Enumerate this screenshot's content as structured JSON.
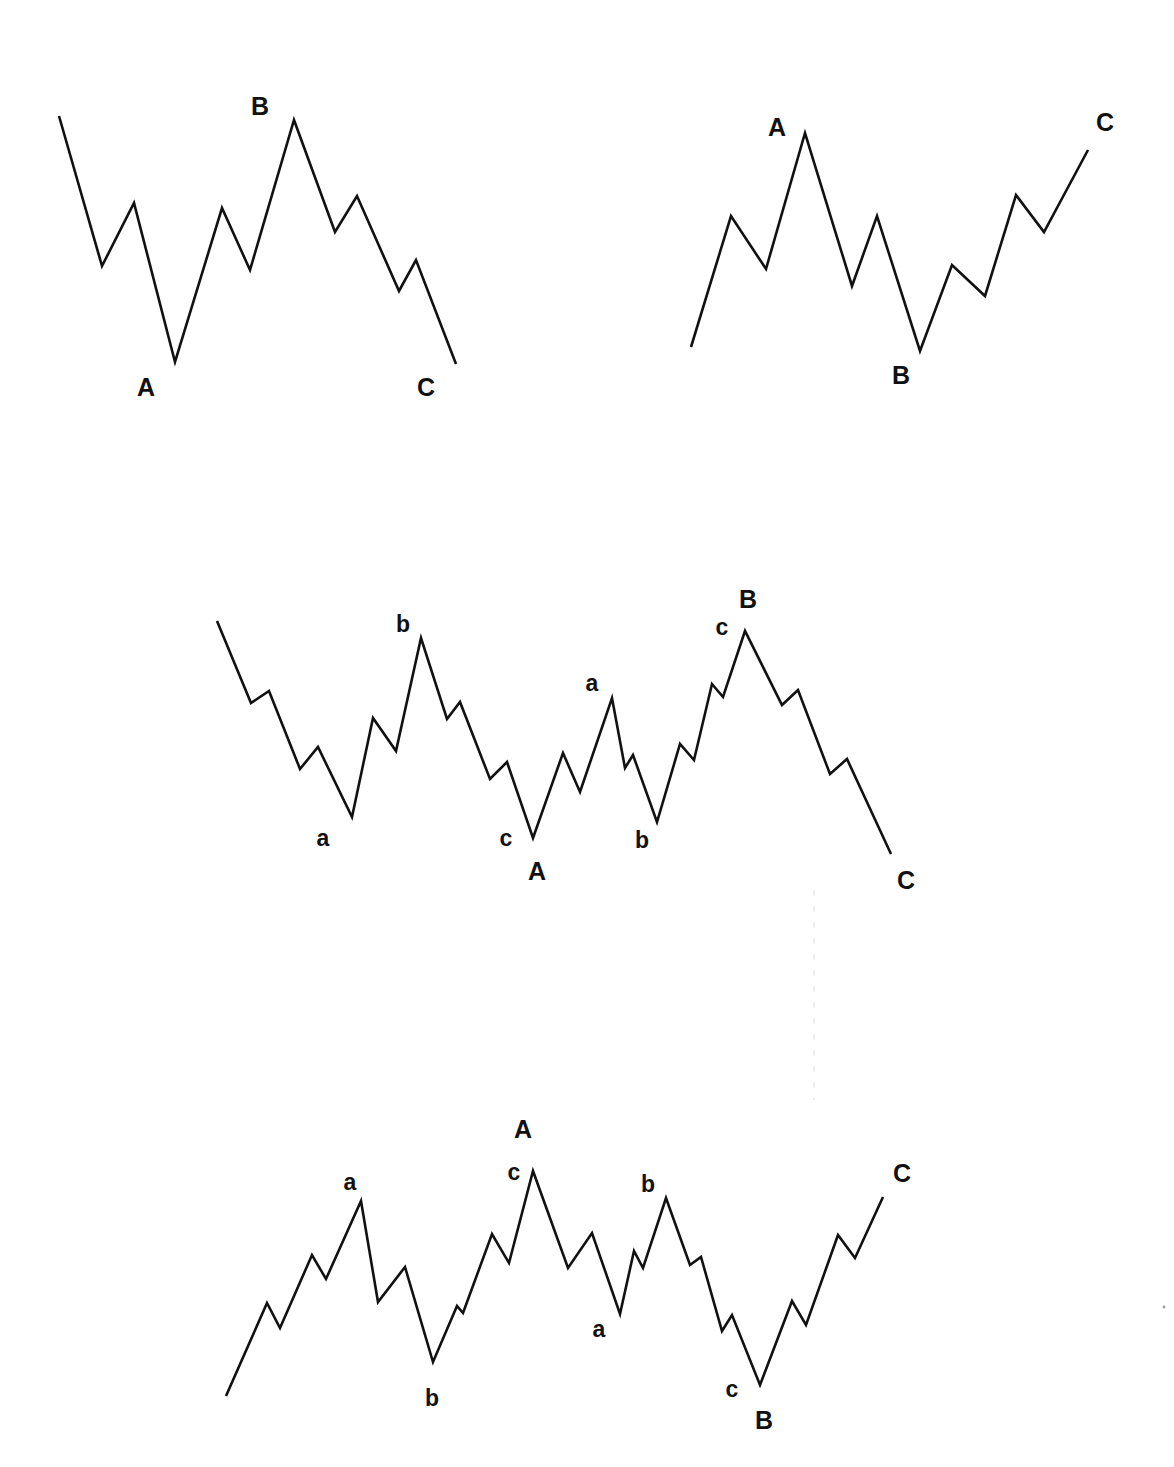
{
  "page": {
    "width": 1174,
    "height": 1467,
    "background": "#ffffff",
    "ink": "#111111"
  },
  "diagrams": [
    {
      "name": "flat-correction-down",
      "points": [
        [
          59,
          116
        ],
        [
          102,
          266
        ],
        [
          134,
          203
        ],
        [
          175,
          362
        ],
        [
          222,
          208
        ],
        [
          250,
          270
        ],
        [
          294,
          120
        ],
        [
          335,
          232
        ],
        [
          357,
          196
        ],
        [
          399,
          291
        ],
        [
          416,
          260
        ],
        [
          456,
          364
        ]
      ],
      "labels": [
        {
          "text": "A",
          "x": 146,
          "y": 396,
          "size": "major"
        },
        {
          "text": "B",
          "x": 260,
          "y": 115,
          "size": "major"
        },
        {
          "text": "C",
          "x": 426,
          "y": 396,
          "size": "major"
        }
      ]
    },
    {
      "name": "flat-correction-up",
      "points": [
        [
          691,
          347
        ],
        [
          731,
          216
        ],
        [
          766,
          269
        ],
        [
          805,
          133
        ],
        [
          852,
          286
        ],
        [
          877,
          216
        ],
        [
          920,
          351
        ],
        [
          952,
          265
        ],
        [
          985,
          296
        ],
        [
          1016,
          195
        ],
        [
          1044,
          232
        ],
        [
          1088,
          150
        ]
      ],
      "labels": [
        {
          "text": "A",
          "x": 777,
          "y": 136,
          "size": "major"
        },
        {
          "text": "B",
          "x": 901,
          "y": 384,
          "size": "major"
        },
        {
          "text": "C",
          "x": 1105,
          "y": 131,
          "size": "major"
        }
      ]
    },
    {
      "name": "complex-correction-down",
      "points": [
        [
          217,
          621
        ],
        [
          251,
          703
        ],
        [
          269,
          691
        ],
        [
          300,
          769
        ],
        [
          318,
          747
        ],
        [
          352,
          817
        ],
        [
          373,
          718
        ],
        [
          396,
          751
        ],
        [
          421,
          638
        ],
        [
          447,
          719
        ],
        [
          460,
          702
        ],
        [
          490,
          779
        ],
        [
          507,
          762
        ],
        [
          533,
          838
        ],
        [
          563,
          753
        ],
        [
          580,
          792
        ],
        [
          612,
          698
        ],
        [
          625,
          768
        ],
        [
          633,
          755
        ],
        [
          657,
          822
        ],
        [
          680,
          744
        ],
        [
          694,
          760
        ],
        [
          712,
          684
        ],
        [
          723,
          697
        ],
        [
          745,
          631
        ],
        [
          782,
          705
        ],
        [
          798,
          690
        ],
        [
          830,
          774
        ],
        [
          847,
          759
        ],
        [
          891,
          854
        ]
      ],
      "labels": [
        {
          "text": "b",
          "x": 403,
          "y": 632,
          "size": "minor"
        },
        {
          "text": "a",
          "x": 323,
          "y": 846,
          "size": "minor"
        },
        {
          "text": "c",
          "x": 506,
          "y": 846,
          "size": "minor"
        },
        {
          "text": "A",
          "x": 537,
          "y": 880,
          "size": "major"
        },
        {
          "text": "a",
          "x": 592,
          "y": 691,
          "size": "minor"
        },
        {
          "text": "b",
          "x": 642,
          "y": 848,
          "size": "minor"
        },
        {
          "text": "c",
          "x": 722,
          "y": 635,
          "size": "minor"
        },
        {
          "text": "B",
          "x": 748,
          "y": 608,
          "size": "major"
        },
        {
          "text": "C",
          "x": 906,
          "y": 889,
          "size": "major"
        }
      ]
    },
    {
      "name": "complex-correction-up",
      "points": [
        [
          226,
          1396
        ],
        [
          267,
          1303
        ],
        [
          280,
          1328
        ],
        [
          312,
          1255
        ],
        [
          326,
          1279
        ],
        [
          361,
          1201
        ],
        [
          378,
          1302
        ],
        [
          405,
          1267
        ],
        [
          433,
          1362
        ],
        [
          457,
          1306
        ],
        [
          463,
          1313
        ],
        [
          492,
          1234
        ],
        [
          509,
          1263
        ],
        [
          533,
          1171
        ],
        [
          568,
          1268
        ],
        [
          592,
          1233
        ],
        [
          620,
          1314
        ],
        [
          634,
          1251
        ],
        [
          643,
          1268
        ],
        [
          666,
          1198
        ],
        [
          690,
          1265
        ],
        [
          701,
          1257
        ],
        [
          722,
          1331
        ],
        [
          732,
          1315
        ],
        [
          760,
          1385
        ],
        [
          792,
          1301
        ],
        [
          806,
          1325
        ],
        [
          838,
          1235
        ],
        [
          855,
          1258
        ],
        [
          883,
          1197
        ]
      ],
      "labels": [
        {
          "text": "a",
          "x": 350,
          "y": 1190,
          "size": "minor"
        },
        {
          "text": "b",
          "x": 432,
          "y": 1406,
          "size": "minor"
        },
        {
          "text": "c",
          "x": 514,
          "y": 1180,
          "size": "minor"
        },
        {
          "text": "A",
          "x": 523,
          "y": 1138,
          "size": "major"
        },
        {
          "text": "a",
          "x": 599,
          "y": 1337,
          "size": "minor"
        },
        {
          "text": "b",
          "x": 648,
          "y": 1192,
          "size": "minor"
        },
        {
          "text": "c",
          "x": 732,
          "y": 1397,
          "size": "minor"
        },
        {
          "text": "B",
          "x": 764,
          "y": 1429,
          "size": "major"
        },
        {
          "text": "C",
          "x": 902,
          "y": 1182,
          "size": "major"
        }
      ]
    }
  ],
  "artifacts": {
    "faint_vertical_line": {
      "x": 814,
      "y1": 890,
      "y2": 1100
    },
    "faint_dot": {
      "x": 1164,
      "y": 1307
    }
  }
}
